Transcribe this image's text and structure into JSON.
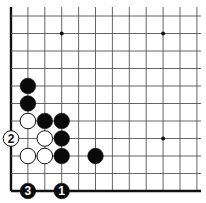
{
  "diagram": {
    "type": "go-board-corner",
    "corner": "bottom-left",
    "grid": {
      "x0": 11,
      "y0": 191,
      "dx": 16.9,
      "dy": 17.5,
      "cols": 12,
      "rows": 11,
      "line_color": "#555555",
      "edge_color": "#111111"
    },
    "star_points": [
      {
        "col": 3,
        "row": 9
      },
      {
        "col": 9,
        "row": 9
      },
      {
        "col": 9,
        "row": 3
      }
    ],
    "stones": [
      {
        "col": 1,
        "row": 6,
        "color": "black",
        "label": ""
      },
      {
        "col": 1,
        "row": 5,
        "color": "black",
        "label": ""
      },
      {
        "col": 1,
        "row": 4,
        "color": "white",
        "label": ""
      },
      {
        "col": 2,
        "row": 4,
        "color": "black",
        "label": ""
      },
      {
        "col": 3,
        "row": 4,
        "color": "black",
        "label": ""
      },
      {
        "col": 0,
        "row": 3,
        "color": "white",
        "label": "2"
      },
      {
        "col": 2,
        "row": 3,
        "color": "white",
        "label": ""
      },
      {
        "col": 3,
        "row": 3,
        "color": "black",
        "label": ""
      },
      {
        "col": 1,
        "row": 2,
        "color": "white",
        "label": ""
      },
      {
        "col": 2,
        "row": 2,
        "color": "white",
        "label": ""
      },
      {
        "col": 3,
        "row": 2,
        "color": "black",
        "label": ""
      },
      {
        "col": 5,
        "row": 2,
        "color": "black",
        "label": ""
      },
      {
        "col": 1,
        "row": 0,
        "color": "black",
        "label": "3"
      },
      {
        "col": 3,
        "row": 0,
        "color": "black",
        "label": "1"
      }
    ]
  }
}
